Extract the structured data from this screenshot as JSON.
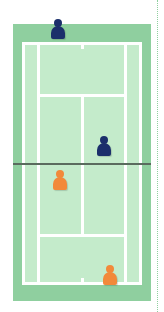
{
  "diagram": {
    "type": "tennis-doubles-court-top-view",
    "colors": {
      "outer_court": "#8fcf9f",
      "inner_court": "#c4ebcb",
      "lines": "#ffffff",
      "net": "#5a6b5e",
      "team_top": "#1b2f6b",
      "team_bottom": "#f2893a"
    },
    "players": [
      {
        "team": "navy",
        "position": "top-baseline-left-center"
      },
      {
        "team": "navy",
        "position": "top-net-right"
      },
      {
        "team": "orange",
        "position": "bottom-service-box-left"
      },
      {
        "team": "orange",
        "position": "bottom-baseline-right"
      }
    ]
  }
}
